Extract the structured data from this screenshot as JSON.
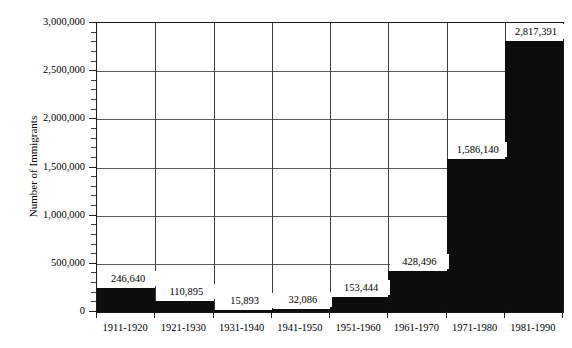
{
  "chart_data": {
    "type": "bar",
    "title": "",
    "xlabel": "",
    "ylabel": "Number of Immigrants",
    "categories": [
      "1911-1920",
      "1921-1930",
      "1931-1940",
      "1941-1950",
      "1951-1960",
      "1961-1970",
      "1971-1980",
      "1981-1990"
    ],
    "values": [
      246640,
      110895,
      15893,
      32086,
      153444,
      428496,
      1586140,
      2817391
    ],
    "value_labels": [
      "246,640",
      "110,895",
      "15,893",
      "32,086",
      "153,444",
      "428,496",
      "1,586,140",
      "2,817,391"
    ],
    "ylim": [
      0,
      3000000
    ],
    "ytick_labels": [
      "0",
      "500,000",
      "1,000,000",
      "1,500,000",
      "2,000,000",
      "2,500,000",
      "3,000,000"
    ],
    "ytick_values": [
      0,
      500000,
      1000000,
      1500000,
      2000000,
      2500000,
      3000000
    ],
    "yminor_step": 100000,
    "grid": true,
    "legend": "none",
    "bar_color": "#0d0d0d",
    "background_color": "#ffffff",
    "axis_color": "#1a1a1a",
    "grid_color": "#5d5d5d"
  }
}
